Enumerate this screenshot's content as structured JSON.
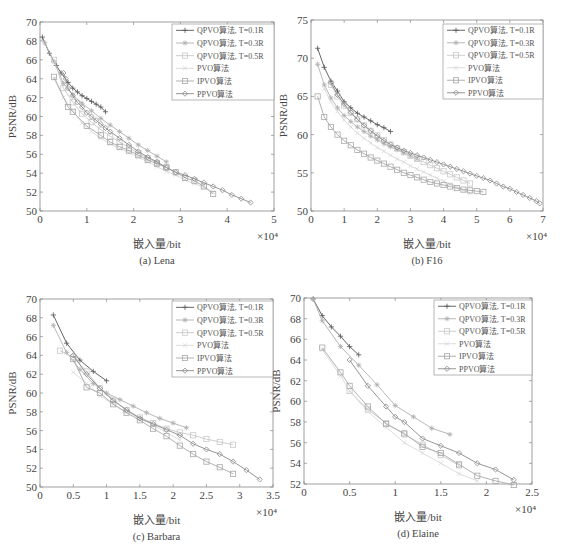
{
  "legend": [
    {
      "label": "QPVO算法, T=0.1R",
      "marker": "plus",
      "color": "#555555"
    },
    {
      "label": "QPVO算法, T=0.3R",
      "marker": "star",
      "color": "#b0b0b0"
    },
    {
      "label": "QPVO算法, T=0.5R",
      "marker": "square",
      "color": "#c8c8c8"
    },
    {
      "label": "PVO算法",
      "marker": "cross",
      "color": "#d8d8d8"
    },
    {
      "label": "IPVO算法",
      "marker": "square",
      "color": "#a8a8a8"
    },
    {
      "label": "PPVO算法",
      "marker": "diamond",
      "color": "#8a8a8a"
    }
  ],
  "chart_data": [
    {
      "type": "line",
      "caption": "(a) Lena",
      "xlabel": "嵌入量/bit",
      "ylabel": "PSNR/dB",
      "x_multiplier": "×10⁴",
      "xlim": [
        0,
        5
      ],
      "ylim": [
        50,
        70
      ],
      "xticks": [
        0,
        1,
        2,
        3,
        4,
        5
      ],
      "yticks": [
        50,
        52,
        54,
        56,
        58,
        60,
        62,
        64,
        66,
        68,
        70
      ],
      "frame": {
        "x0": 40,
        "x1": 274,
        "y0": 22,
        "y1": 211
      },
      "legend_box": {
        "x": 172,
        "y": 24,
        "w": 102,
        "h": 76
      },
      "series": [
        {
          "name": "QPVO算法, T=0.1R",
          "x": [
            0.05,
            0.2,
            0.35,
            0.45,
            0.6,
            0.7,
            0.8,
            0.9,
            1.0,
            1.1,
            1.2,
            1.3,
            1.4
          ],
          "y": [
            68.4,
            66.7,
            65.4,
            64.6,
            63.6,
            63.0,
            62.6,
            62.2,
            61.9,
            61.6,
            61.3,
            61.0,
            60.5
          ]
        },
        {
          "name": "QPVO算法, T=0.3R",
          "x": [
            0.1,
            0.3,
            0.5,
            0.7,
            0.9,
            1.1,
            1.3,
            1.5,
            1.7,
            1.9,
            2.1,
            2.3,
            2.5,
            2.7
          ],
          "y": [
            67.8,
            65.8,
            63.5,
            62.3,
            61.4,
            60.6,
            59.8,
            59.1,
            58.4,
            57.7,
            57.0,
            56.4,
            55.8,
            55.2
          ]
        },
        {
          "name": "QPVO算法, T=0.5R",
          "x": [
            0.3,
            0.5,
            0.7,
            0.9,
            1.1,
            1.3,
            1.5,
            1.7,
            1.9,
            2.1,
            2.3,
            2.5,
            2.7
          ],
          "y": [
            66.0,
            63.0,
            61.5,
            60.3,
            59.4,
            58.6,
            57.9,
            57.3,
            56.7,
            56.1,
            55.6,
            55.1,
            54.6
          ]
        },
        {
          "name": "PVO算法",
          "x": [
            0.3,
            0.5,
            0.7,
            0.9,
            1.1,
            1.3,
            1.5,
            1.7,
            1.9,
            2.1,
            2.3,
            2.5,
            2.7,
            2.9,
            3.1,
            3.3,
            3.5,
            3.7
          ],
          "y": [
            64.0,
            62.0,
            60.6,
            59.3,
            58.4,
            57.7,
            57.1,
            56.6,
            56.2,
            55.7,
            55.2,
            54.7,
            54.2,
            53.8,
            53.3,
            52.9,
            52.5,
            52.0
          ]
        },
        {
          "name": "IPVO算法",
          "x": [
            0.3,
            0.6,
            0.7,
            1.0,
            1.3,
            1.5,
            1.7,
            1.9,
            2.1,
            2.3,
            2.5,
            2.7,
            2.9,
            3.1,
            3.3,
            3.5,
            3.7
          ],
          "y": [
            64.2,
            61.0,
            60.5,
            59.0,
            58.0,
            57.3,
            56.8,
            56.4,
            55.9,
            55.4,
            55.0,
            54.6,
            54.1,
            53.5,
            53.2,
            52.6,
            51.8
          ]
        },
        {
          "name": "PPVO算法",
          "x": [
            0.5,
            0.55,
            0.6,
            0.7,
            0.8,
            0.9,
            1.0,
            1.1,
            1.2,
            1.3,
            1.4,
            1.5,
            1.7,
            1.9,
            2.1,
            2.3,
            2.5,
            2.7,
            2.9,
            3.1,
            3.3,
            3.5,
            3.7,
            3.9,
            4.1,
            4.3,
            4.5
          ],
          "y": [
            64.6,
            64.0,
            63.0,
            62.2,
            61.5,
            61.0,
            60.4,
            60.0,
            59.6,
            59.2,
            58.8,
            58.4,
            57.7,
            57.0,
            56.3,
            55.7,
            55.2,
            54.6,
            54.1,
            53.8,
            53.4,
            53.0,
            52.6,
            52.2,
            51.7,
            51.3,
            50.9
          ]
        }
      ]
    },
    {
      "type": "line",
      "caption": "(b) F16",
      "xlabel": "嵌入量/bit",
      "ylabel": "PSNR/dB",
      "x_multiplier": "×10⁴",
      "xlim": [
        0,
        7
      ],
      "ylim": [
        50,
        75
      ],
      "xticks": [
        0,
        1,
        2,
        3,
        4,
        5,
        6,
        7
      ],
      "yticks": [
        50,
        55,
        60,
        65,
        70,
        75
      ],
      "frame": {
        "x0": 311,
        "x1": 543,
        "y0": 20,
        "y1": 211
      },
      "legend_box": {
        "x": 443,
        "y": 24,
        "w": 100,
        "h": 75
      },
      "series": [
        {
          "name": "QPVO算法, T=0.1R",
          "x": [
            0.2,
            0.4,
            0.6,
            0.8,
            1.0,
            1.2,
            1.4,
            1.6,
            1.8,
            2.0,
            2.2,
            2.4
          ],
          "y": [
            71.3,
            68.8,
            67.0,
            65.7,
            64.3,
            63.5,
            62.8,
            62.3,
            61.8,
            61.3,
            60.9,
            60.4
          ]
        },
        {
          "name": "QPVO算法, T=0.3R",
          "x": [
            0.2,
            0.4,
            0.6,
            0.8,
            1.0,
            1.2,
            1.4,
            1.6,
            1.8,
            2.0,
            2.2,
            2.4,
            2.6,
            2.8,
            3.0,
            3.2
          ],
          "y": [
            69.2,
            66.5,
            64.8,
            63.5,
            62.5,
            61.7,
            61.0,
            60.4,
            59.8,
            59.3,
            58.8,
            58.4,
            58.0,
            57.6,
            57.2,
            56.8
          ]
        },
        {
          "name": "QPVO算法, T=0.5R",
          "x": [
            0.6,
            0.8,
            1.0,
            1.2,
            1.4,
            1.6,
            1.8,
            2.0,
            2.2,
            2.4,
            2.6,
            2.8,
            3.0,
            3.2,
            3.4,
            3.6,
            3.8,
            4.0,
            4.2,
            4.4,
            4.6,
            4.8
          ],
          "y": [
            66.5,
            65.0,
            63.8,
            62.8,
            62.0,
            61.2,
            60.5,
            59.9,
            59.3,
            58.7,
            58.2,
            57.7,
            57.2,
            56.8,
            56.4,
            56.0,
            55.6,
            55.2,
            54.8,
            54.4,
            54.0,
            53.6
          ]
        },
        {
          "name": "PVO算法",
          "x": [
            0.4,
            0.6,
            0.8,
            1.0,
            1.2,
            1.4,
            1.6,
            1.8,
            2.0,
            2.2,
            2.4,
            2.6,
            2.8,
            3.0,
            3.2,
            3.4,
            3.6,
            3.8,
            4.0,
            4.2,
            4.4,
            4.6,
            4.8
          ],
          "y": [
            66.0,
            64.3,
            63.0,
            61.9,
            61.0,
            60.2,
            59.5,
            58.9,
            58.3,
            57.8,
            57.3,
            56.8,
            56.4,
            55.9,
            55.5,
            55.1,
            54.7,
            54.3,
            53.9,
            53.5,
            53.1,
            52.7,
            52.3
          ]
        },
        {
          "name": "IPVO算法",
          "x": [
            0.2,
            0.4,
            0.6,
            0.8,
            1.0,
            1.2,
            1.4,
            1.6,
            1.8,
            2.0,
            2.2,
            2.4,
            2.6,
            2.8,
            3.0,
            3.2,
            3.4,
            3.6,
            3.8,
            4.0,
            4.2,
            4.4,
            4.6,
            4.8,
            5.0,
            5.2
          ],
          "y": [
            65.0,
            62.3,
            61.0,
            60.0,
            59.2,
            58.6,
            58.0,
            57.5,
            57.0,
            56.6,
            56.2,
            55.8,
            55.4,
            55.0,
            54.7,
            54.4,
            54.1,
            53.8,
            53.6,
            53.4,
            53.2,
            53.0,
            52.8,
            52.7,
            52.6,
            52.5
          ]
        },
        {
          "name": "PPVO算法",
          "x": [
            0.6,
            0.8,
            1.0,
            1.2,
            1.4,
            1.6,
            1.8,
            2.0,
            2.2,
            2.4,
            2.6,
            2.8,
            3.0,
            3.2,
            3.4,
            3.6,
            3.8,
            4.0,
            4.2,
            4.4,
            4.6,
            4.8,
            5.0,
            5.2,
            5.4,
            5.6,
            5.8,
            6.0,
            6.2,
            6.4,
            6.6,
            6.8,
            6.9
          ],
          "y": [
            66.8,
            65.2,
            64.0,
            62.9,
            62.0,
            61.2,
            60.5,
            59.8,
            59.2,
            58.7,
            58.3,
            57.9,
            57.6,
            57.3,
            57.0,
            56.7,
            56.4,
            56.1,
            55.8,
            55.5,
            55.2,
            54.9,
            54.6,
            54.3,
            54.0,
            53.6,
            53.2,
            52.9,
            52.5,
            52.1,
            51.7,
            51.3,
            51.0
          ]
        }
      ]
    },
    {
      "type": "line",
      "caption": "(c) Barbara",
      "xlabel": "嵌入量/bit",
      "ylabel": "PSNR/dB",
      "x_multiplier": "×10⁴",
      "xlim": [
        0,
        3.5
      ],
      "ylim": [
        50,
        70
      ],
      "xticks": [
        0,
        0.5,
        1,
        1.5,
        2,
        2.5,
        3,
        3.5
      ],
      "yticks": [
        50,
        52,
        54,
        56,
        58,
        60,
        62,
        64,
        66,
        68,
        70
      ],
      "frame": {
        "x0": 40,
        "x1": 273,
        "y0": 299,
        "y1": 487
      },
      "legend_box": {
        "x": 172,
        "y": 301,
        "w": 101,
        "h": 76
      },
      "series": [
        {
          "name": "QPVO算法, T=0.1R",
          "x": [
            0.2,
            0.4,
            0.6,
            0.8,
            1.0
          ],
          "y": [
            68.3,
            65.3,
            63.5,
            62.3,
            61.3
          ]
        },
        {
          "name": "QPVO算法, T=0.3R",
          "x": [
            0.2,
            0.4,
            0.6,
            0.8,
            1.0,
            1.2,
            1.4,
            1.6,
            1.8,
            2.0,
            2.2
          ],
          "y": [
            67.2,
            64.3,
            62.5,
            61.0,
            60.0,
            59.3,
            58.6,
            57.9,
            57.3,
            56.8,
            56.3
          ]
        },
        {
          "name": "QPVO算法, T=0.5R",
          "x": [
            0.3,
            0.5,
            0.7,
            0.9,
            1.1,
            1.3,
            1.5,
            1.7,
            1.9,
            2.1,
            2.3,
            2.5,
            2.7,
            2.9
          ],
          "y": [
            64.5,
            63.8,
            62.3,
            60.5,
            59.3,
            58.2,
            57.4,
            56.8,
            56.2,
            55.8,
            55.5,
            55.1,
            54.8,
            54.5
          ]
        },
        {
          "name": "PVO算法",
          "x": [
            0.5,
            0.7,
            0.9,
            1.1,
            1.3,
            1.5,
            1.7,
            1.9,
            2.1
          ],
          "y": [
            62.2,
            61.0,
            59.7,
            58.8,
            58.0,
            57.3,
            56.6,
            55.8,
            55.0
          ]
        },
        {
          "name": "IPVO算法",
          "x": [
            0.5,
            0.7,
            0.9,
            1.1,
            1.3,
            1.5,
            1.7,
            1.9,
            2.1,
            2.3,
            2.5,
            2.7,
            2.9
          ],
          "y": [
            63.6,
            60.6,
            60.0,
            58.8,
            57.9,
            57.1,
            56.2,
            55.4,
            54.4,
            53.5,
            52.7,
            52.1,
            51.4
          ]
        },
        {
          "name": "PPVO算法",
          "x": [
            0.5,
            0.7,
            0.9,
            1.1,
            1.3,
            1.5,
            1.7,
            1.9,
            2.1,
            2.3,
            2.5,
            2.7,
            2.9,
            3.1,
            3.3
          ],
          "y": [
            64.0,
            62.0,
            60.5,
            59.2,
            58.2,
            57.3,
            56.7,
            56.1,
            55.5,
            54.6,
            54.0,
            53.5,
            52.7,
            51.8,
            50.8
          ]
        }
      ]
    },
    {
      "type": "line",
      "caption": "(d) Elaine",
      "xlabel": "嵌入量/bit",
      "ylabel": "PSNR/dB",
      "x_multiplier": "×10⁴",
      "xlim": [
        0,
        2.5
      ],
      "ylim": [
        52,
        70
      ],
      "xticks": [
        0,
        0.5,
        1,
        1.5,
        2,
        2.5
      ],
      "yticks": [
        52,
        54,
        56,
        58,
        60,
        62,
        64,
        66,
        68,
        70
      ],
      "frame": {
        "x0": 304,
        "x1": 532,
        "y0": 298,
        "y1": 484
      },
      "legend_box": {
        "x": 434,
        "y": 300,
        "w": 98,
        "h": 75
      },
      "series": [
        {
          "name": "QPVO算法, T=0.1R",
          "x": [
            0.1,
            0.2,
            0.3,
            0.4,
            0.5,
            0.6
          ],
          "y": [
            69.9,
            68.3,
            67.2,
            66.3,
            65.3,
            64.5
          ]
        },
        {
          "name": "QPVO算法, T=0.3R",
          "x": [
            0.1,
            0.2,
            0.4,
            0.6,
            0.8,
            1.0,
            1.2,
            1.4,
            1.6
          ],
          "y": [
            69.9,
            67.8,
            65.3,
            63.5,
            61.6,
            59.6,
            58.5,
            57.4,
            56.8
          ]
        },
        {
          "name": "QPVO算法, T=0.5R",
          "x": [
            0.5,
            0.7,
            0.9,
            1.1,
            1.3,
            1.5,
            1.7
          ],
          "y": [
            61.0,
            59.2,
            57.9,
            56.8,
            55.8,
            54.8,
            53.8
          ]
        },
        {
          "name": "PVO算法",
          "x": [
            0.2,
            0.4,
            0.5,
            0.7,
            0.9,
            1.1,
            1.3,
            1.5,
            1.7,
            1.9
          ],
          "y": [
            65.0,
            62.5,
            61.0,
            59.0,
            57.5,
            56.0,
            55.0,
            54.0,
            53.0,
            52.3
          ]
        },
        {
          "name": "IPVO算法",
          "x": [
            0.2,
            0.4,
            0.5,
            0.7,
            0.9,
            1.1,
            1.3,
            1.5,
            1.7,
            1.9,
            2.1,
            2.3
          ],
          "y": [
            65.2,
            62.8,
            61.5,
            59.5,
            57.8,
            56.9,
            55.6,
            55.0,
            53.9,
            52.8,
            52.3,
            51.9
          ]
        },
        {
          "name": "PPVO算法",
          "x": [
            0.5,
            0.7,
            0.9,
            1.0,
            1.1,
            1.3,
            1.5,
            1.7,
            1.9,
            2.1,
            2.3
          ],
          "y": [
            64.0,
            61.5,
            59.5,
            58.5,
            58.0,
            56.4,
            55.7,
            55.0,
            54.0,
            53.4,
            52.4
          ]
        }
      ]
    }
  ]
}
